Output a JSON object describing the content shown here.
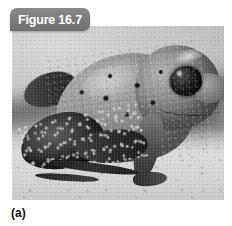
{
  "figure": {
    "tab_label": "Figure 16.7",
    "panel_caption": "(a)",
    "tab_color": "#7a7a7a",
    "tab_text_color": "#ffffff",
    "caption_color": "#111111",
    "background_color": "#ffffff"
  },
  "photo": {
    "subject": "poison dart frog",
    "rendering": "grayscale photograph",
    "description": "Close-up side view of a spotted frog perched on light rock, dark speckled hind leg in foreground, large dark eye facing right",
    "alt_text": "Grayscale photograph of a poison dart frog with dark dorsal spots"
  }
}
